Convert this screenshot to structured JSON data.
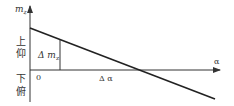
{
  "diagram": {
    "y_axis_label": "m",
    "y_axis_subscript": "z",
    "x_axis_label": "α",
    "upper_region_label_1": "上",
    "upper_region_label_2": "仰",
    "lower_region_label_1": "下",
    "lower_region_label_2": "俯",
    "origin_label": "0",
    "delta_m_label": "Δ m",
    "delta_m_subscript": "z",
    "delta_alpha_label": "Δ α",
    "colors": {
      "line": "#333333",
      "background": "#ffffff"
    }
  }
}
